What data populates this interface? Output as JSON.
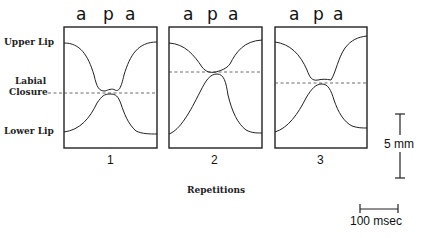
{
  "figure": {
    "phonemes": [
      "a",
      "p",
      "a"
    ],
    "row_labels": {
      "upper": "Upper Lip",
      "closure_line1": "Labial",
      "closure_line2": "Closure",
      "lower": "Lower Lip"
    },
    "panels": [
      {
        "label": "1",
        "x": 64,
        "closure_y": 93
      },
      {
        "label": "2",
        "x": 169,
        "closure_y": 72
      },
      {
        "label": "3",
        "x": 275,
        "closure_y": 83
      }
    ],
    "xlabel": "Repetitions",
    "scale_bars": {
      "vertical": "5 mm",
      "horizontal": "100 msec"
    }
  }
}
